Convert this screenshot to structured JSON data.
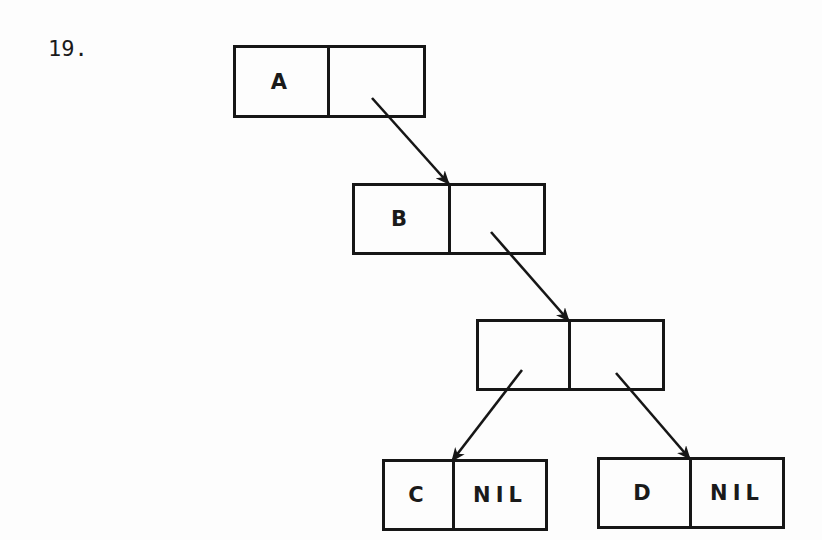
{
  "problem_number": "19.",
  "nodes": [
    {
      "id": "n1",
      "car": "A",
      "cdr": "",
      "x": 233,
      "y": 45,
      "w": 193,
      "h": 73,
      "divider": 94
    },
    {
      "id": "n2",
      "car": "B",
      "cdr": "",
      "x": 352,
      "y": 183,
      "w": 194,
      "h": 72,
      "divider": 96
    },
    {
      "id": "n3",
      "car": "",
      "cdr": "",
      "x": 476,
      "y": 319,
      "w": 189,
      "h": 72,
      "divider": 92
    },
    {
      "id": "n4",
      "car": "C",
      "cdr": "NIL",
      "x": 382,
      "y": 459,
      "w": 166,
      "h": 72,
      "divider": 70
    },
    {
      "id": "n5",
      "car": "D",
      "cdr": "NIL",
      "x": 597,
      "y": 457,
      "w": 188,
      "h": 72,
      "divider": 92
    }
  ],
  "edges": [
    {
      "from": "n1.cdr",
      "to": "n2",
      "x1": 372,
      "y1": 98,
      "x2": 449,
      "y2": 184
    },
    {
      "from": "n2.cdr",
      "to": "n3",
      "x1": 491,
      "y1": 232,
      "x2": 569,
      "y2": 321
    },
    {
      "from": "n3.car",
      "to": "n4",
      "x1": 522,
      "y1": 370,
      "x2": 452,
      "y2": 461
    },
    {
      "from": "n3.cdr",
      "to": "n5",
      "x1": 616,
      "y1": 373,
      "x2": 690,
      "y2": 459
    }
  ],
  "colors": {
    "stroke": "#161616",
    "background": "#fdfdfd"
  }
}
